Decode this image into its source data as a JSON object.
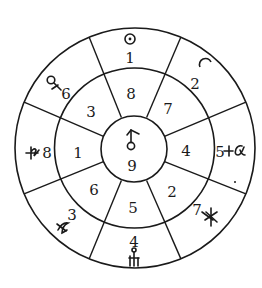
{
  "diagram": {
    "type": "concentric-sector-wheel",
    "rings": 3,
    "sectors": 8,
    "center": {
      "symbol": "uranus-like-symbol",
      "number": "9"
    },
    "middle_ring": {
      "n": "8",
      "ne": "7",
      "e": "4",
      "se": "2",
      "s": "5",
      "sw": "6",
      "w": "1",
      "nw": "3"
    },
    "outer_ring": {
      "n": {
        "number": "1",
        "symbol": "sun-symbol"
      },
      "ne": {
        "number": "2",
        "symbol": "moon-symbol"
      },
      "e": {
        "number": "5",
        "symbol": "alpha-cross-symbol"
      },
      "se": {
        "number": "7",
        "symbol": "asterisk-cross-symbol"
      },
      "s": {
        "number": "4",
        "symbol": "fork-ring-symbol"
      },
      "sw": {
        "number": "3",
        "symbol": "crossed-curve-symbol"
      },
      "w": {
        "number": "8",
        "symbol": "saturn-like-symbol"
      },
      "nw": {
        "number": "6",
        "symbol": "venus-like-symbol"
      }
    },
    "colors": {
      "stroke": "#1a1a1a",
      "background": "#ffffff"
    }
  }
}
